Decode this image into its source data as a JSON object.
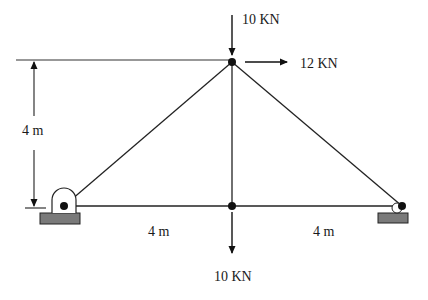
{
  "diagram": {
    "type": "truss",
    "nodes": [
      {
        "id": "A",
        "role": "left-pin-support",
        "x": 64,
        "y": 206
      },
      {
        "id": "B",
        "role": "bottom-middle",
        "x": 232,
        "y": 206
      },
      {
        "id": "C",
        "role": "right-roller-support",
        "x": 402,
        "y": 206
      },
      {
        "id": "D",
        "role": "top-apex",
        "x": 232,
        "y": 62
      }
    ],
    "members": [
      {
        "from": "A",
        "to": "B"
      },
      {
        "from": "B",
        "to": "C"
      },
      {
        "from": "A",
        "to": "D"
      },
      {
        "from": "D",
        "to": "C"
      },
      {
        "from": "B",
        "to": "D"
      }
    ],
    "loads": [
      {
        "node": "D",
        "direction": "down",
        "label": "10 KN"
      },
      {
        "node": "D",
        "direction": "right",
        "label": "12 KN"
      },
      {
        "node": "B",
        "direction": "down",
        "label": "10 KN"
      }
    ],
    "dimensions": {
      "height": "4 m",
      "left_span": "4 m",
      "right_span": "4 m"
    },
    "colors": {
      "line": "#222222",
      "support_base": "#7a7a7a",
      "background": "#ffffff"
    }
  }
}
